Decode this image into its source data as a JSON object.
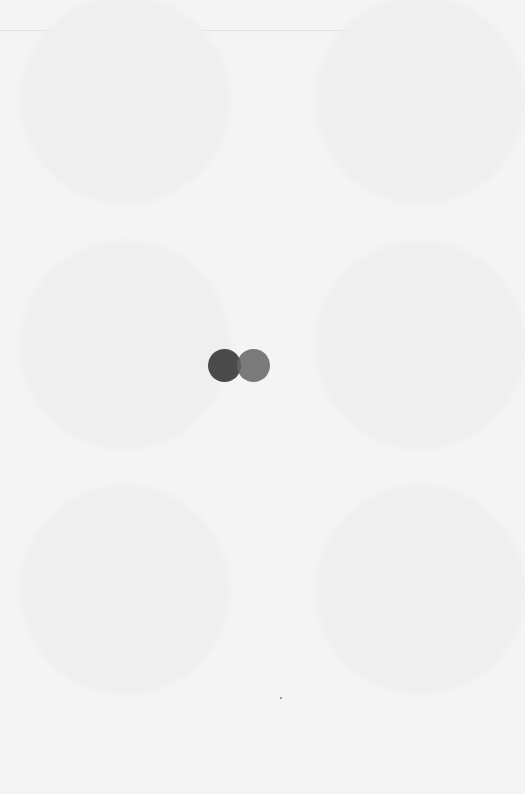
{
  "screen": {
    "state": "loading",
    "background_color": "#f4f4f4"
  },
  "spinner": {
    "type": "two-dot-loader",
    "dot_colors": [
      "#3c3c3c",
      "#646464"
    ]
  },
  "placeholders": [
    {
      "cx": 125,
      "cy": 100,
      "r": 105
    },
    {
      "cx": 400,
      "cy": 100,
      "r": 105
    },
    {
      "cx": 125,
      "cy": 345,
      "r": 105
    },
    {
      "cx": 400,
      "cy": 345,
      "r": 105
    },
    {
      "cx": 125,
      "cy": 590,
      "r": 105
    },
    {
      "cx": 400,
      "cy": 590,
      "r": 105
    }
  ]
}
